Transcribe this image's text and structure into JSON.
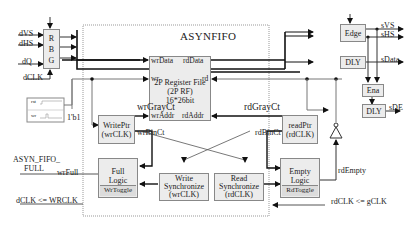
{
  "diagram": {
    "title": "ASYNFIFO",
    "inputs": {
      "dVS": "dVS",
      "dHS": "dHS",
      "dQ": "dQ",
      "dCLK": "dCLK"
    },
    "rbg_block": {
      "lines": [
        "R",
        "B",
        "G"
      ]
    },
    "register_file": {
      "ports": {
        "wrData": "wrData",
        "rdData": "rdData",
        "wr": "wr",
        "rd": "rd",
        "wrAddr": "wrAddr",
        "rdAddr": "rdAddr"
      },
      "line1": "2P Register File",
      "line2": "(2P RF)",
      "line3": "16*26bit"
    },
    "write_ptr": {
      "line1": "WritePtr",
      "line2": "(wrCLK)"
    },
    "read_ptr": {
      "line1": "readPtr",
      "line2": "(rdCLK)"
    },
    "full_logic": {
      "line1": "Full",
      "line2": "Logic",
      "sub": "WrToggle"
    },
    "empty_logic": {
      "line1": "Empty",
      "line2": "Logic",
      "sub": "RdToggle"
    },
    "write_sync": {
      "line1": "Write",
      "line2": "Synchronize",
      "line3": "(wrCLK)"
    },
    "read_sync": {
      "line1": "Read",
      "line2": "Synchronize",
      "line3": "(rdCLK)"
    },
    "signals": {
      "wrGrayCt": "wrGrayCt",
      "wrBinCt": "wrBinCt",
      "rdGrayCt": "rdGrayCt",
      "rdBinCt": "rdBinCt",
      "wrFull": "wrFull",
      "rdEmpty": "rdEmpty",
      "const": "1'b1",
      "full_out_line1": "ASYN_FIFO_",
      "full_out_line2": "FULL",
      "dclk_assign": "dCLK <= WRCLK",
      "rdclk_assign": "rdCLK <= gCLK"
    },
    "waveform": {
      "rst": "rst",
      "wr": "wr"
    },
    "edge_block": "Edge",
    "dly_block_1": "DLY",
    "ena_block": "Ena",
    "dly_block_2": "DLY",
    "outputs": {
      "sVS": "sVS",
      "sHS": "sHS",
      "sData": "sData",
      "sDE": "sDE"
    }
  }
}
